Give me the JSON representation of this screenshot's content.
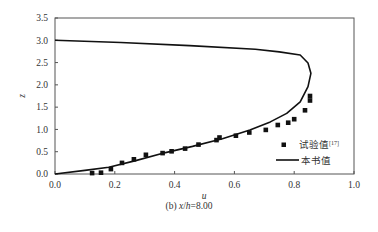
{
  "chart_data": {
    "type": "scatter+line",
    "title": "",
    "caption": "(b) x/h=8.00",
    "caption_parts": {
      "prefix": "(b) ",
      "var1": "x",
      "slash": "/",
      "var2": "h",
      "suffix": "=8.00"
    },
    "xlabel": "u",
    "ylabel": "z",
    "xlim": [
      0.0,
      1.0
    ],
    "ylim": [
      0.0,
      3.5
    ],
    "xticks": [
      "0.0",
      "0.2",
      "0.4",
      "0.6",
      "0.8",
      "1.0"
    ],
    "yticks": [
      "0.0",
      "0.5",
      "1.0",
      "1.5",
      "2.0",
      "2.5",
      "3.0",
      "3.5"
    ],
    "grid": false,
    "legend_position": "lower right inside",
    "series": [
      {
        "name": "试验值[17]",
        "label_main": "试验值",
        "label_sup": "[17]",
        "style": "square-markers",
        "color": "#111111",
        "points": [
          [
            0.124,
            0.02
          ],
          [
            0.154,
            0.03
          ],
          [
            0.187,
            0.11
          ],
          [
            0.224,
            0.25
          ],
          [
            0.264,
            0.33
          ],
          [
            0.304,
            0.43
          ],
          [
            0.36,
            0.47
          ],
          [
            0.39,
            0.51
          ],
          [
            0.435,
            0.57
          ],
          [
            0.48,
            0.66
          ],
          [
            0.54,
            0.76
          ],
          [
            0.55,
            0.82
          ],
          [
            0.605,
            0.86
          ],
          [
            0.65,
            0.93
          ],
          [
            0.705,
            0.99
          ],
          [
            0.745,
            1.1
          ],
          [
            0.78,
            1.15
          ],
          [
            0.8,
            1.23
          ],
          [
            0.836,
            1.43
          ],
          [
            0.853,
            1.65
          ],
          [
            0.853,
            1.75
          ]
        ]
      },
      {
        "name": "本书值",
        "style": "solid-line",
        "color": "#111111",
        "points": [
          [
            0.0,
            0.0
          ],
          [
            0.1,
            0.08
          ],
          [
            0.18,
            0.15
          ],
          [
            0.27,
            0.3
          ],
          [
            0.37,
            0.48
          ],
          [
            0.46,
            0.62
          ],
          [
            0.56,
            0.79
          ],
          [
            0.652,
            0.99
          ],
          [
            0.72,
            1.17
          ],
          [
            0.775,
            1.36
          ],
          [
            0.82,
            1.62
          ],
          [
            0.846,
            1.96
          ],
          [
            0.856,
            2.26
          ],
          [
            0.846,
            2.49
          ],
          [
            0.82,
            2.67
          ],
          [
            0.75,
            2.74
          ],
          [
            0.67,
            2.8
          ],
          [
            0.45,
            2.88
          ],
          [
            0.22,
            2.95
          ],
          [
            0.0,
            3.0
          ]
        ]
      }
    ]
  }
}
